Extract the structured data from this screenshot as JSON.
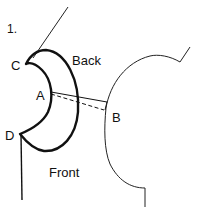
{
  "figure": {
    "number": "1.",
    "labels": {
      "back": "Back",
      "front": "Front",
      "point_a": "A",
      "point_b": "B",
      "point_c": "C",
      "point_d": "D"
    },
    "colors": {
      "stroke": "#111111",
      "background": "#ffffff"
    }
  }
}
